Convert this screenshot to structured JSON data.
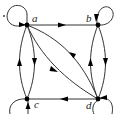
{
  "diagram": {
    "type": "directed-graph",
    "nodes": [
      {
        "id": "a",
        "label": "a",
        "self_loop": true
      },
      {
        "id": "b",
        "label": "b",
        "self_loop": true
      },
      {
        "id": "c",
        "label": "c",
        "self_loop": true
      },
      {
        "id": "d",
        "label": "d",
        "self_loop": true
      }
    ],
    "edges": [
      {
        "from": "a",
        "to": "b"
      },
      {
        "from": "b",
        "to": "d"
      },
      {
        "from": "d",
        "to": "b"
      },
      {
        "from": "a",
        "to": "c"
      },
      {
        "from": "c",
        "to": "a"
      },
      {
        "from": "d",
        "to": "c"
      },
      {
        "from": "a",
        "to": "d"
      },
      {
        "from": "d",
        "to": "a"
      },
      {
        "from": "a",
        "to": "a"
      },
      {
        "from": "b",
        "to": "b"
      },
      {
        "from": "c",
        "to": "c"
      },
      {
        "from": "d",
        "to": "d"
      }
    ],
    "colors": {
      "stroke": "#333333",
      "node": "#000000"
    }
  }
}
